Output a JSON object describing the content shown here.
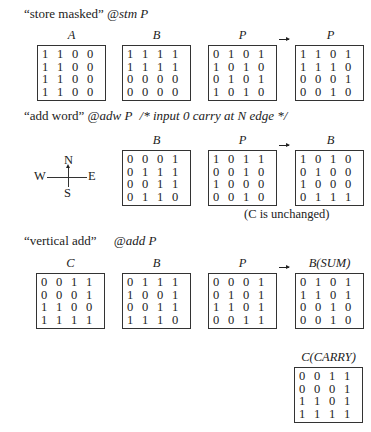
{
  "sections": [
    {
      "caption_quote": "“store masked”",
      "caption_cmd": "@stm P",
      "comment": "",
      "matrices": [
        {
          "label": "A",
          "rows": [
            [
              1,
              1,
              0,
              0
            ],
            [
              1,
              1,
              0,
              0
            ],
            [
              1,
              1,
              0,
              0
            ],
            [
              1,
              1,
              0,
              0
            ]
          ]
        },
        {
          "label": "B",
          "rows": [
            [
              1,
              1,
              1,
              1
            ],
            [
              1,
              1,
              1,
              1
            ],
            [
              0,
              0,
              0,
              0
            ],
            [
              0,
              0,
              0,
              0
            ]
          ]
        },
        {
          "label": "P",
          "rows": [
            [
              0,
              1,
              0,
              1
            ],
            [
              1,
              0,
              1,
              0
            ],
            [
              0,
              1,
              0,
              1
            ],
            [
              1,
              0,
              1,
              0
            ]
          ]
        },
        {
          "label": "P",
          "rows": [
            [
              1,
              1,
              0,
              1
            ],
            [
              1,
              1,
              1,
              0
            ],
            [
              0,
              0,
              0,
              1
            ],
            [
              0,
              0,
              1,
              0
            ]
          ]
        }
      ]
    },
    {
      "caption_quote": "“add word”",
      "caption_cmd": "@adw P",
      "comment": "/* input 0 carry at N edge */",
      "matrices": [
        {
          "label": "B",
          "rows": [
            [
              0,
              0,
              0,
              1
            ],
            [
              0,
              1,
              1,
              1
            ],
            [
              0,
              0,
              1,
              1
            ],
            [
              0,
              1,
              1,
              0
            ]
          ]
        },
        {
          "label": "P",
          "rows": [
            [
              1,
              0,
              1,
              1
            ],
            [
              0,
              0,
              1,
              0
            ],
            [
              1,
              0,
              0,
              0
            ],
            [
              0,
              0,
              1,
              0
            ]
          ]
        },
        {
          "label": "B",
          "rows": [
            [
              1,
              0,
              1,
              0
            ],
            [
              0,
              1,
              0,
              0
            ],
            [
              1,
              0,
              0,
              0
            ],
            [
              0,
              1,
              1,
              1
            ]
          ]
        }
      ],
      "note": "(C is unchanged)",
      "compass": {
        "n": "N",
        "s": "S",
        "e": "E",
        "w": "W"
      }
    },
    {
      "caption_quote": "“vertical add”",
      "caption_cmd": "@add P",
      "comment": "",
      "matrices": [
        {
          "label": "C",
          "rows": [
            [
              0,
              0,
              1,
              1
            ],
            [
              0,
              0,
              0,
              1
            ],
            [
              1,
              1,
              0,
              0
            ],
            [
              1,
              1,
              1,
              1
            ]
          ]
        },
        {
          "label": "B",
          "rows": [
            [
              0,
              1,
              1,
              1
            ],
            [
              1,
              0,
              0,
              1
            ],
            [
              0,
              0,
              1,
              1
            ],
            [
              1,
              1,
              1,
              0
            ]
          ]
        },
        {
          "label": "P",
          "rows": [
            [
              0,
              0,
              0,
              1
            ],
            [
              0,
              1,
              0,
              1
            ],
            [
              1,
              1,
              0,
              1
            ],
            [
              0,
              0,
              1,
              1
            ]
          ]
        },
        {
          "label": "B(SUM)",
          "rows": [
            [
              0,
              1,
              0,
              1
            ],
            [
              1,
              1,
              0,
              1
            ],
            [
              0,
              0,
              1,
              0
            ],
            [
              0,
              0,
              1,
              0
            ]
          ]
        },
        {
          "label": "C(CARRY)",
          "rows": [
            [
              0,
              0,
              1,
              1
            ],
            [
              0,
              0,
              0,
              1
            ],
            [
              1,
              1,
              0,
              1
            ],
            [
              1,
              1,
              1,
              1
            ]
          ]
        }
      ]
    }
  ]
}
